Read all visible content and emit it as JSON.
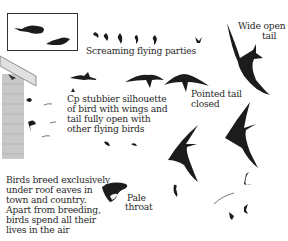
{
  "plate": {
    "subject": "Swift identification plate",
    "colors": {
      "silhouette": "#1c1c1c",
      "building": "#bdbdbd",
      "text": "#2a2a2a",
      "background": "#ffffff"
    }
  },
  "labels": {
    "screaming": "Screaming flying parties",
    "wide_tail_1": "Wide open",
    "wide_tail_2": "tail",
    "pointed_1": "Pointed tail",
    "pointed_2": "closed",
    "compare_1": "Cp stubbier silhouette",
    "compare_2": "of bird with wings and",
    "compare_3": "tail fully open with",
    "compare_4": "other flying birds",
    "breed_1": "Birds breed exclusively",
    "breed_2": "under roof eaves in",
    "breed_3": "town and country.",
    "breed_4": "Apart from breeding,",
    "breed_5": "birds spend all their",
    "breed_6": "lives in the air",
    "throat_1": "Pale",
    "throat_2": "throat"
  },
  "icons": {
    "inset": "perched-bird-silhouettes-icon",
    "building": "roof-eaves-building-icon",
    "swift": "swift-silhouette-icon",
    "head": "swift-head-icon"
  }
}
